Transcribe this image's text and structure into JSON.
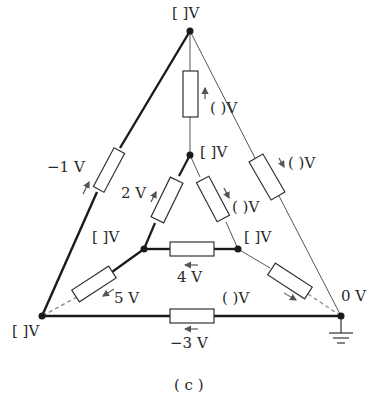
{
  "figure": {
    "caption": "( c )",
    "nodes": {
      "top": {
        "label": "[ ]V"
      },
      "center": {
        "label": "[ ]V"
      },
      "inner_left": {
        "label": "[ ]V"
      },
      "inner_right": {
        "label": "[ ]V"
      },
      "bottom_left": {
        "label": "[ ]V"
      },
      "bottom_right": {
        "label": "0 V"
      }
    },
    "resistors": {
      "top_vertical": {
        "label": "( )V"
      },
      "right_outer": {
        "label": "( )V"
      },
      "center_right": {
        "label": "( )V"
      },
      "left_outer": {
        "label": "−1 V"
      },
      "center_left": {
        "label": "2 V"
      },
      "inner_horizontal": {
        "label": "4 V"
      },
      "inner_to_bottom_left": {
        "label": "5 V"
      },
      "inner_to_bottom_right": {
        "label": "( )V"
      },
      "bottom": {
        "label": "−3 V"
      }
    },
    "ground_symbol": "ground-icon",
    "colors": {
      "line": "#1a1a1a",
      "thin_line": "#555555",
      "text": "#2a2a2a"
    }
  }
}
